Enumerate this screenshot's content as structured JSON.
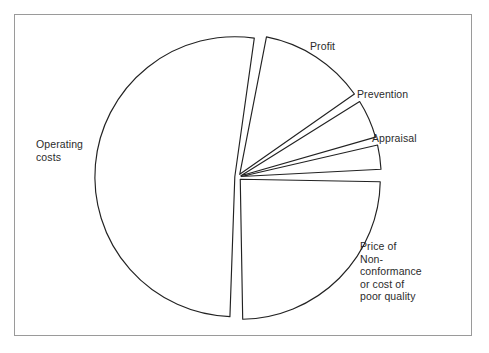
{
  "figure": {
    "frame_color": "#9a9a9a",
    "background_color": "#ffffff",
    "stroke_color": "#222222"
  },
  "chart_data": {
    "type": "pie",
    "title": "",
    "subtitle": "",
    "xlabel": "",
    "ylabel": "",
    "legend_position": "none",
    "grid": false,
    "exploded": true,
    "start_angle_deg": 0,
    "direction": "clockwise",
    "categories": [
      "Operating costs",
      "Profit",
      "Prevention",
      "Appraisal",
      "Price of Non-conformance or cost of poor quality"
    ],
    "values": [
      51,
      12,
      5,
      3,
      25
    ],
    "units": "percent",
    "slices": [
      {
        "name": "Operating costs",
        "label": "Operating\ncosts",
        "value": 51,
        "start_angle_deg": 182,
        "end_angle_deg": 368,
        "fill": "#ffffff",
        "stroke": "#222222"
      },
      {
        "name": "Profit",
        "label": "Profit",
        "value": 12,
        "start_angle_deg": 11,
        "end_angle_deg": 55,
        "fill": "#ffffff",
        "stroke": "#222222"
      },
      {
        "name": "Prevention",
        "label": "Prevention",
        "value": 5,
        "start_angle_deg": 58,
        "end_angle_deg": 74,
        "fill": "#ffffff",
        "stroke": "#222222"
      },
      {
        "name": "Appraisal",
        "label": "Appraisal",
        "value": 3,
        "start_angle_deg": 77,
        "end_angle_deg": 87,
        "fill": "#ffffff",
        "stroke": "#222222"
      },
      {
        "name": "Price of Non-conformance or cost of poor quality",
        "label": "Price of\nNon-\nconformance\nor cost of\npoor quality",
        "value": 25,
        "start_angle_deg": 91,
        "end_angle_deg": 179,
        "fill": "#ffffff",
        "stroke": "#222222"
      }
    ]
  },
  "labels": {
    "operating_costs": "Operating\ncosts",
    "profit": "Profit",
    "prevention": "Prevention",
    "appraisal": "Appraisal",
    "price_of_nonconformance": "Price of\nNon-\nconformance\nor cost of\npoor quality"
  }
}
